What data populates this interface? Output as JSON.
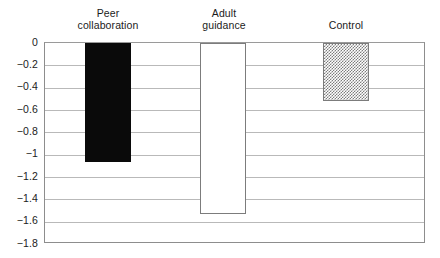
{
  "chart_data": {
    "type": "bar",
    "title": "",
    "xlabel": "",
    "ylabel": "",
    "categories": [
      "Peer\ncollaboration",
      "Adult\nguidance",
      "Control"
    ],
    "values": [
      -1.07,
      -1.53,
      -0.52
    ],
    "series": [
      {
        "name": "",
        "values": [
          -1.07,
          -1.53,
          -0.52
        ]
      }
    ],
    "ylim": [
      -1.8,
      0
    ],
    "yticks": [
      0,
      -0.2,
      -0.4,
      -0.6,
      -0.8,
      -1,
      -1.2,
      -1.4,
      -1.6,
      -1.8
    ],
    "ytick_labels": [
      "0",
      "−0.2",
      "−0.4",
      "−0.6",
      "−0.8",
      "−1",
      "−1.2",
      "−1.4",
      "−1.6",
      "−1.8"
    ],
    "grid": true,
    "legend": "none",
    "bar_styles": [
      "solid-black",
      "open-white",
      "dotted-gray"
    ],
    "orientation": "vertical-downward",
    "colors": {
      "bar_solid": "#0a0a0a",
      "bar_open_fill": "#ffffff",
      "bar_open_edge": "#7c7c7c",
      "bar_dotted_pattern": "#7d7d7d",
      "gridline": "#b9b9b9",
      "frame": "#8d8d8d",
      "text": "#1b1b1b",
      "background": "#ffffff"
    }
  },
  "labels": {
    "cat_0": "Peer\ncollaboration",
    "cat_1": "Adult\nguidance",
    "cat_2": "Control",
    "y_0": "0",
    "y_1": "−0.2",
    "y_2": "−0.4",
    "y_3": "−0.6",
    "y_4": "−0.8",
    "y_5": "−1",
    "y_6": "−1.2",
    "y_7": "−1.4",
    "y_8": "−1.6",
    "y_9": "−1.8"
  }
}
